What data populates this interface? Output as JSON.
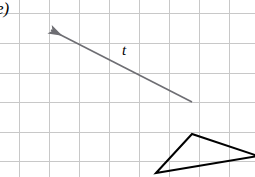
{
  "figure": {
    "width": 255,
    "height": 177,
    "background_color": "#ffffff",
    "part_label": "e)",
    "vector_label": "t"
  },
  "grid": {
    "line_color": "#c8c8c8",
    "line_width": 1,
    "cell_size": 30,
    "vertical_lines_x": [
      19,
      49,
      79,
      109,
      139,
      169,
      199,
      229
    ],
    "horizontal_lines_y": [
      13,
      43,
      73,
      102,
      132,
      161
    ]
  },
  "vector": {
    "name": "t",
    "color": "#6e6e73",
    "line_width": 1.6,
    "tail": {
      "x": 192,
      "y": 102
    },
    "tip": {
      "x": 51,
      "y": 30
    },
    "arrowhead": "filled-triangle",
    "label": "t",
    "label_position": {
      "x": 126,
      "y": 52
    }
  },
  "triangle": {
    "color": "#000000",
    "line_width": 2,
    "fill": "none",
    "vertices": [
      {
        "x": 156,
        "y": 173
      },
      {
        "x": 192,
        "y": 134
      },
      {
        "x": 258,
        "y": 156
      }
    ]
  }
}
